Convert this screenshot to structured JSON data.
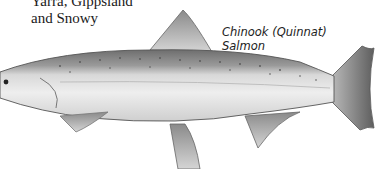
{
  "labels": {
    "region_line1": "Yarra, Gippsland",
    "region_line2": "and Snowy",
    "species_line1": "Chinook (Quinnat)",
    "species_line2": "Salmon"
  },
  "illustration": {
    "subject": "fish-illustration",
    "style": "grayscale"
  }
}
